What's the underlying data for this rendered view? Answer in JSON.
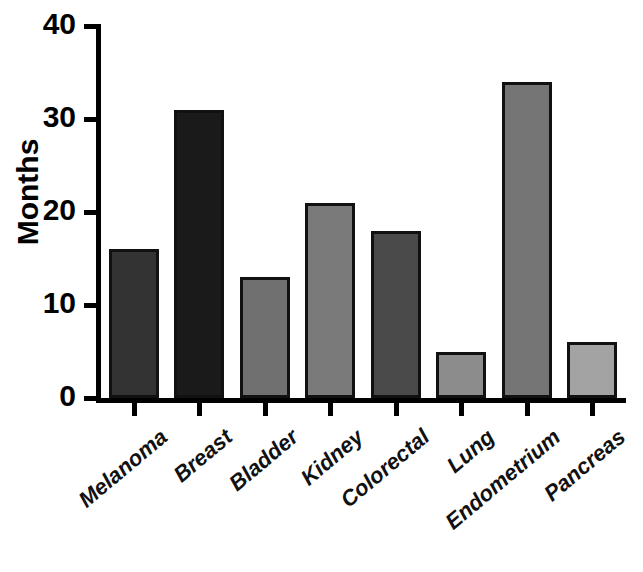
{
  "chart_data": {
    "type": "bar",
    "title": "",
    "subtitle": "",
    "xlabel": "",
    "ylabel": "Months",
    "categories": [
      "Melanoma",
      "Breast",
      "Bladder",
      "Kidney",
      "Colorectal",
      "Lung",
      "Endometrium",
      "Pancreas"
    ],
    "values": [
      16,
      31,
      13,
      21,
      18,
      5,
      34,
      6
    ],
    "bar_colors": [
      "#333333",
      "#1a1a1a",
      "#707070",
      "#7a7a7a",
      "#4a4a4a",
      "#8c8c8c",
      "#757575",
      "#a3a3a3"
    ],
    "bar_border_color": "#111111",
    "ylim": [
      0,
      40
    ],
    "yticks": [
      0,
      10,
      20,
      30,
      40
    ],
    "ytick_labels": [
      "0",
      "10",
      "20",
      "30",
      "40"
    ],
    "grid": false,
    "legend": "none",
    "axis_color": "#000000",
    "background_color": "#ffffff",
    "xlabel_rotation_deg": -40
  },
  "axes": {
    "y_title": "Months"
  }
}
